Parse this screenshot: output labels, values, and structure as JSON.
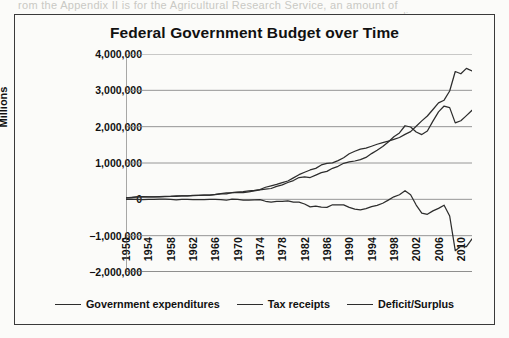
{
  "page": {
    "bleed_text_top": "rom the Appendix II is for the Agricultural Research Service, an amount of",
    "bleed_text_right": "unding"
  },
  "chart_data": {
    "type": "line",
    "title": "Federal Government Budget over Time",
    "xlabel": "",
    "ylabel": "Millions",
    "ylim": [
      -2000000,
      4000000
    ],
    "xlim": [
      1950,
      2012
    ],
    "grid": true,
    "legend_position": "bottom",
    "ytick_labels": [
      "4,000,000",
      "3,000,000",
      "2,000,000",
      "1,000,000",
      "0",
      "−1,000,000",
      "−2,000,000"
    ],
    "ytick_values": [
      4000000,
      3000000,
      2000000,
      1000000,
      0,
      -1000000,
      -2000000
    ],
    "xtick_labels": [
      "1950",
      "1954",
      "1958",
      "1962",
      "1966",
      "1970",
      "1974",
      "1978",
      "1982",
      "1986",
      "1990",
      "1994",
      "1998",
      "2002",
      "2006",
      "2010"
    ],
    "xtick_values": [
      1950,
      1954,
      1958,
      1962,
      1966,
      1970,
      1974,
      1978,
      1982,
      1986,
      1990,
      1994,
      1998,
      2002,
      2006,
      2010
    ],
    "x": [
      1950,
      1951,
      1952,
      1953,
      1954,
      1955,
      1956,
      1957,
      1958,
      1959,
      1960,
      1961,
      1962,
      1963,
      1964,
      1965,
      1966,
      1967,
      1968,
      1969,
      1970,
      1971,
      1972,
      1973,
      1974,
      1975,
      1976,
      1977,
      1978,
      1979,
      1980,
      1981,
      1982,
      1983,
      1984,
      1985,
      1986,
      1987,
      1988,
      1989,
      1990,
      1991,
      1992,
      1993,
      1994,
      1995,
      1996,
      1997,
      1998,
      1999,
      2000,
      2001,
      2002,
      2003,
      2004,
      2005,
      2006,
      2007,
      2008,
      2009,
      2010,
      2011,
      2012
    ],
    "series": [
      {
        "name": "Government expenditures",
        "color": "#2d2d2d",
        "values": [
          42562,
          45514,
          67686,
          76101,
          70855,
          68444,
          70640,
          76578,
          82405,
          92098,
          92191,
          97723,
          106821,
          111316,
          118528,
          118228,
          134532,
          157464,
          178134,
          183640,
          195649,
          210172,
          230681,
          245707,
          269359,
          332332,
          371792,
          409218,
          458746,
          504028,
          590941,
          678241,
          745743,
          808364,
          851805,
          946344,
          990382,
          1004017,
          1064417,
          1143744,
          1252993,
          1324226,
          1381529,
          1409386,
          1461752,
          1515742,
          1560484,
          1601116,
          1652458,
          1701842,
          1788950,
          1862846,
          2010894,
          2159899,
          2292841,
          2471957,
          2655050,
          2728686,
          2982544,
          3517677,
          3456213,
          3603059,
          3537127
        ]
      },
      {
        "name": "Tax receipts",
        "color": "#2d2d2d",
        "values": [
          39443,
          51616,
          66167,
          69608,
          69701,
          65451,
          74587,
          79990,
          79636,
          79249,
          92492,
          94388,
          99676,
          106560,
          112613,
          116817,
          130835,
          148822,
          152973,
          186882,
          192807,
          187139,
          207309,
          230799,
          263224,
          279090,
          298060,
          355559,
          399561,
          463302,
          517112,
          599272,
          617766,
          600562,
          666438,
          734037,
          769155,
          854288,
          909238,
          991105,
          1031958,
          1055041,
          1091208,
          1154335,
          1258566,
          1351790,
          1453053,
          1579232,
          1721728,
          1827452,
          2025191,
          1991082,
          1853136,
          1782314,
          1880114,
          2153611,
          2406869,
          2567985,
          2523991,
          2104989,
          2162724,
          2303466,
          2449988
        ]
      },
      {
        "name": "Deficit/Surplus",
        "color": "#2d2d2d",
        "values": [
          -3119,
          6102,
          -1519,
          -6493,
          -1154,
          -2993,
          3947,
          3412,
          -2769,
          -12849,
          301,
          -3335,
          -7146,
          -4756,
          -5915,
          -1411,
          -3698,
          -8643,
          -25161,
          3242,
          -2842,
          -23033,
          -23373,
          -14908,
          -6135,
          -53242,
          -73732,
          -53659,
          -59186,
          -40726,
          -73830,
          -78968,
          -127977,
          -207802,
          -185367,
          -212308,
          -221227,
          -149730,
          -155178,
          -152639,
          -221036,
          -269238,
          -290321,
          -255051,
          -203186,
          -163952,
          -107431,
          -21884,
          69270,
          125610,
          236241,
          128236,
          -157758,
          -377585,
          -412727,
          -318346,
          -248181,
          -160701,
          -458553,
          -1412688,
          -1293489,
          -1299593,
          -1087139
        ]
      }
    ]
  },
  "legend": [
    {
      "label": "Government expenditures"
    },
    {
      "label": "Tax receipts"
    },
    {
      "label": "Deficit/Surplus"
    }
  ]
}
